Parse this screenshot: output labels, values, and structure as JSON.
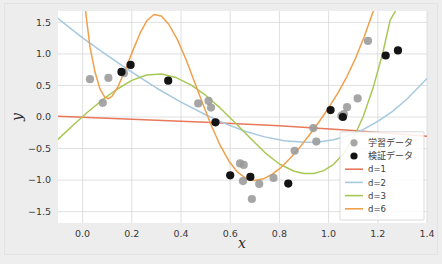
{
  "chart_data": {
    "type": "scatter",
    "title": "",
    "xlabel": "x",
    "ylabel": "y",
    "xlim": [
      -0.1,
      1.4
    ],
    "ylim": [
      -1.68,
      1.68
    ],
    "xticks": [
      0.0,
      0.2,
      0.4,
      0.6,
      0.8,
      1.0,
      1.2,
      1.4
    ],
    "xticklabels": [
      "0.0",
      "0.2",
      "0.4",
      "0.6",
      "0.8",
      "1.0",
      "1.2",
      "1.4"
    ],
    "yticks": [
      -1.5,
      -1.0,
      -0.5,
      0.0,
      0.5,
      1.0,
      1.5
    ],
    "yticklabels": [
      "−1.5",
      "−1.0",
      "−0.5",
      "0.0",
      "0.5",
      "1.0",
      "1.5"
    ],
    "grid": true,
    "grid_color": "#d8d8d8",
    "plot_bg": "#ffffff",
    "figure_bg": "#ededed",
    "legend_position": "lower right",
    "series": [
      {
        "name": "学習データ",
        "kind": "scatter",
        "color": "#9a9a9a",
        "marker": "circle",
        "points": [
          [
            0.03,
            0.6
          ],
          [
            0.105,
            0.62
          ],
          [
            0.082,
            0.225
          ],
          [
            0.168,
            0.695
          ],
          [
            0.47,
            0.215
          ],
          [
            0.512,
            0.255
          ],
          [
            0.522,
            0.15
          ],
          [
            0.64,
            -0.735
          ],
          [
            0.655,
            -0.76
          ],
          [
            0.652,
            -1.015
          ],
          [
            0.688,
            -1.3
          ],
          [
            0.718,
            -1.06
          ],
          [
            0.776,
            -0.965
          ],
          [
            0.862,
            -0.535
          ],
          [
            0.938,
            -0.175
          ],
          [
            0.95,
            -0.39
          ],
          [
            1.052,
            0.02
          ],
          [
            1.062,
            0.045
          ],
          [
            1.075,
            0.155
          ],
          [
            1.118,
            0.295
          ],
          [
            1.16,
            1.205
          ]
        ]
      },
      {
        "name": "検証データ",
        "kind": "scatter",
        "color": "#141414",
        "marker": "circle",
        "points": [
          [
            0.158,
            0.715
          ],
          [
            0.195,
            0.825
          ],
          [
            0.348,
            0.575
          ],
          [
            0.54,
            -0.085
          ],
          [
            0.6,
            -0.925
          ],
          [
            0.682,
            -0.95
          ],
          [
            0.836,
            -1.055
          ],
          [
            1.008,
            0.11
          ],
          [
            1.058,
            0.0
          ],
          [
            1.232,
            0.975
          ],
          [
            1.282,
            1.055
          ]
        ]
      },
      {
        "name": "d=1",
        "kind": "line",
        "color": "#e8785a",
        "path": [
          [
            -0.1,
            0.012
          ],
          [
            0.2,
            -0.035
          ],
          [
            0.5,
            -0.085
          ],
          [
            0.8,
            -0.14
          ],
          [
            1.1,
            -0.215
          ],
          [
            1.4,
            -0.305
          ]
        ]
      },
      {
        "name": "d=2",
        "kind": "line",
        "color": "#a6c8e0",
        "path": [
          [
            -0.1,
            1.56
          ],
          [
            0.0,
            1.255
          ],
          [
            0.1,
            0.975
          ],
          [
            0.2,
            0.71
          ],
          [
            0.3,
            0.46
          ],
          [
            0.4,
            0.235
          ],
          [
            0.5,
            0.035
          ],
          [
            0.58,
            -0.105
          ],
          [
            0.66,
            -0.225
          ],
          [
            0.74,
            -0.315
          ],
          [
            0.82,
            -0.375
          ],
          [
            0.9,
            -0.4
          ],
          [
            0.96,
            -0.395
          ],
          [
            1.02,
            -0.36
          ],
          [
            1.08,
            -0.295
          ],
          [
            1.14,
            -0.2
          ],
          [
            1.2,
            -0.07
          ],
          [
            1.26,
            0.09
          ],
          [
            1.32,
            0.29
          ],
          [
            1.4,
            0.61
          ]
        ]
      },
      {
        "name": "d=3",
        "kind": "line",
        "color": "#a8c856",
        "path": [
          [
            -0.1,
            -0.355
          ],
          [
            -0.04,
            -0.135
          ],
          [
            0.02,
            0.075
          ],
          [
            0.08,
            0.27
          ],
          [
            0.14,
            0.44
          ],
          [
            0.2,
            0.58
          ],
          [
            0.26,
            0.665
          ],
          [
            0.32,
            0.68
          ],
          [
            0.38,
            0.625
          ],
          [
            0.44,
            0.51
          ],
          [
            0.5,
            0.345
          ],
          [
            0.56,
            0.14
          ],
          [
            0.62,
            -0.09
          ],
          [
            0.68,
            -0.33
          ],
          [
            0.74,
            -0.56
          ],
          [
            0.8,
            -0.745
          ],
          [
            0.86,
            -0.86
          ],
          [
            0.9,
            -0.895
          ],
          [
            0.94,
            -0.895
          ],
          [
            0.98,
            -0.85
          ],
          [
            1.02,
            -0.75
          ],
          [
            1.06,
            -0.585
          ],
          [
            1.1,
            -0.34
          ],
          [
            1.14,
            0.0
          ],
          [
            1.18,
            0.45
          ],
          [
            1.22,
            1.01
          ],
          [
            1.25,
            1.53
          ],
          [
            1.272,
            1.68
          ]
        ]
      },
      {
        "name": "d=6",
        "kind": "line",
        "color": "#f0a04b",
        "path": [
          [
            0.012,
            1.68
          ],
          [
            0.03,
            1.11
          ],
          [
            0.05,
            0.72
          ],
          [
            0.07,
            0.45
          ],
          [
            0.09,
            0.315
          ],
          [
            0.105,
            0.29
          ],
          [
            0.12,
            0.33
          ],
          [
            0.145,
            0.49
          ],
          [
            0.175,
            0.76
          ],
          [
            0.205,
            1.06
          ],
          [
            0.235,
            1.34
          ],
          [
            0.262,
            1.53
          ],
          [
            0.29,
            1.625
          ],
          [
            0.32,
            1.6
          ],
          [
            0.35,
            1.47
          ],
          [
            0.385,
            1.23
          ],
          [
            0.42,
            0.915
          ],
          [
            0.455,
            0.555
          ],
          [
            0.49,
            0.195
          ],
          [
            0.525,
            -0.15
          ],
          [
            0.56,
            -0.455
          ],
          [
            0.595,
            -0.7
          ],
          [
            0.63,
            -0.875
          ],
          [
            0.665,
            -0.975
          ],
          [
            0.7,
            -1.005
          ],
          [
            0.735,
            -0.98
          ],
          [
            0.77,
            -0.91
          ],
          [
            0.805,
            -0.805
          ],
          [
            0.845,
            -0.65
          ],
          [
            0.885,
            -0.47
          ],
          [
            0.925,
            -0.27
          ],
          [
            0.965,
            -0.055
          ],
          [
            1.005,
            0.175
          ],
          [
            1.04,
            0.395
          ],
          [
            1.075,
            0.645
          ],
          [
            1.11,
            0.935
          ],
          [
            1.145,
            1.275
          ],
          [
            1.175,
            1.605
          ],
          [
            1.182,
            1.68
          ]
        ]
      }
    ],
    "legend_entries": [
      {
        "label": "学習データ",
        "type": "marker",
        "color": "#9a9a9a"
      },
      {
        "label": "検証データ",
        "type": "marker",
        "color": "#141414"
      },
      {
        "label": "d=1",
        "type": "line",
        "color": "#e8785a"
      },
      {
        "label": "d=2",
        "type": "line",
        "color": "#a6c8e0"
      },
      {
        "label": "d=3",
        "type": "line",
        "color": "#a8c856"
      },
      {
        "label": "d=6",
        "type": "line",
        "color": "#f0a04b"
      }
    ]
  }
}
